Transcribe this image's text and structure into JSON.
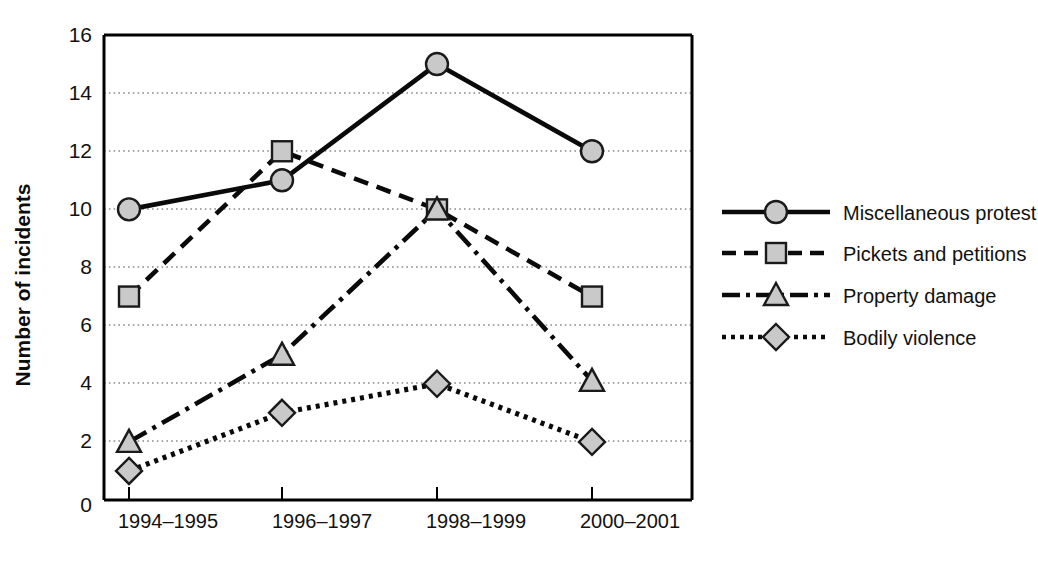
{
  "chart_data": {
    "type": "line",
    "title": "",
    "xlabel": "",
    "ylabel": "Number of incidents",
    "categories": [
      "1994–1995",
      "1996–1997",
      "1998–1999",
      "2000–2001"
    ],
    "ylim": [
      0,
      16
    ],
    "yticks": [
      0,
      2,
      4,
      6,
      8,
      10,
      12,
      14,
      16
    ],
    "grid": "horizontal-dotted",
    "legend_position": "right",
    "series": [
      {
        "name": "Miscellaneous protest",
        "values": [
          10,
          11,
          15,
          12
        ],
        "marker": "circle",
        "linestyle": "solid"
      },
      {
        "name": "Pickets and petitions",
        "values": [
          7,
          12,
          10,
          7
        ],
        "marker": "square",
        "linestyle": "dashed"
      },
      {
        "name": "Property damage",
        "values": [
          2,
          5,
          10,
          4.1
        ],
        "marker": "triangle",
        "linestyle": "dashdot"
      },
      {
        "name": "Bodily violence",
        "values": [
          1,
          3,
          4,
          2
        ],
        "marker": "diamond",
        "linestyle": "dotted"
      }
    ]
  },
  "axis": {
    "y_title": "Number of incidents",
    "y_tick_labels": [
      "16",
      "14",
      "12",
      "10",
      "8",
      "6",
      "4",
      "2",
      "0"
    ],
    "x_tick_labels": [
      "1994–1995",
      "1996–1997",
      "1998–1999",
      "2000–2001"
    ]
  },
  "legend": {
    "items": [
      {
        "label": "Miscellaneous protest",
        "marker": "circle",
        "linestyle": "solid"
      },
      {
        "label": "Pickets and petitions",
        "marker": "square",
        "linestyle": "dashed"
      },
      {
        "label": "Property damage",
        "marker": "triangle",
        "linestyle": "dashdot"
      },
      {
        "label": "Bodily violence",
        "marker": "diamond",
        "linestyle": "dotted"
      }
    ]
  },
  "colors": {
    "line": "#0a0a0a",
    "marker_fill": "#c9c9c9",
    "marker_stroke": "#1a1a1a",
    "grid": "#8a8a8a",
    "background": "#ffffff"
  },
  "caption": {
    "text": ""
  }
}
